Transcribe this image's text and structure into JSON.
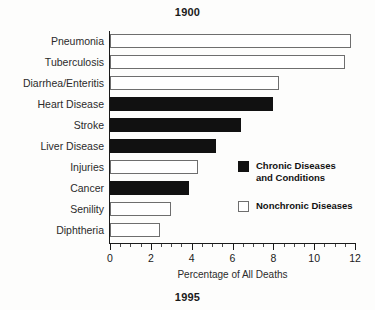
{
  "titles": {
    "top": "1900",
    "bottom": "1995"
  },
  "legend": {
    "items": [
      {
        "label": "Chronic Diseases\nand Conditions",
        "swatch": "filled-black-square",
        "color": "#111111"
      },
      {
        "label": "Nonchronic Diseases",
        "swatch": "open-white-square",
        "color": "#ffffff"
      }
    ]
  },
  "axis": {
    "x_title": "Percentage of All Deaths",
    "x_ticks": [
      "0",
      "2",
      "4",
      "6",
      "8",
      "10",
      "12"
    ]
  },
  "chart_data": {
    "type": "bar",
    "orientation": "horizontal",
    "title": "1900",
    "subtitle": "1995",
    "xlabel": "Percentage of All Deaths",
    "ylabel": "",
    "xlim": [
      0,
      12
    ],
    "xticks": [
      0,
      2,
      4,
      6,
      8,
      10,
      12
    ],
    "minor_tick_step": 0.5,
    "grid": false,
    "legend_position": "right-middle",
    "categories": [
      "Pneumonia",
      "Tuberculosis",
      "Diarrhea/Enteritis",
      "Heart Disease",
      "Stroke",
      "Liver Disease",
      "Injuries",
      "Cancer",
      "Senility",
      "Diphtheria"
    ],
    "values": [
      11.8,
      11.5,
      8.3,
      8.0,
      6.4,
      5.2,
      4.3,
      3.85,
      3.0,
      2.45
    ],
    "series": [
      {
        "name": "Chronic Diseases and Conditions",
        "color": "#111111",
        "members": [
          "Heart Disease",
          "Stroke",
          "Liver Disease",
          "Cancer"
        ]
      },
      {
        "name": "Nonchronic Diseases",
        "color": "#ffffff",
        "members": [
          "Pneumonia",
          "Tuberculosis",
          "Diarrhea/Enteritis",
          "Injuries",
          "Senility",
          "Diphtheria"
        ]
      }
    ],
    "points": [
      {
        "category": "Pneumonia",
        "value": 11.8,
        "group": "Nonchronic Diseases"
      },
      {
        "category": "Tuberculosis",
        "value": 11.5,
        "group": "Nonchronic Diseases"
      },
      {
        "category": "Diarrhea/Enteritis",
        "value": 8.3,
        "group": "Nonchronic Diseases"
      },
      {
        "category": "Heart Disease",
        "value": 8.0,
        "group": "Chronic Diseases and Conditions"
      },
      {
        "category": "Stroke",
        "value": 6.4,
        "group": "Chronic Diseases and Conditions"
      },
      {
        "category": "Liver Disease",
        "value": 5.2,
        "group": "Chronic Diseases and Conditions"
      },
      {
        "category": "Injuries",
        "value": 4.3,
        "group": "Nonchronic Diseases"
      },
      {
        "category": "Cancer",
        "value": 3.85,
        "group": "Chronic Diseases and Conditions"
      },
      {
        "category": "Senility",
        "value": 3.0,
        "group": "Nonchronic Diseases"
      },
      {
        "category": "Diphtheria",
        "value": 2.45,
        "group": "Nonchronic Diseases"
      }
    ]
  }
}
